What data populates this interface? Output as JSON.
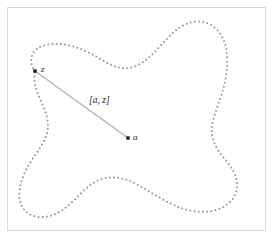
{
  "figure": {
    "caption_none": "",
    "background_color": "#ffffff",
    "frame": {
      "border_color": "#d8d8d8",
      "x": 7,
      "y": 7,
      "width": 259,
      "height": 224
    },
    "region": {
      "name": "star-shaped-region-boundary",
      "style": "dotted",
      "dot_color": "#9a9aa6",
      "dot_radius": 1.0,
      "dot_spacing": 4.2,
      "closed": true,
      "path": "M 35 72 C 27 60, 32 48, 46 45 C 62 41, 82 48, 97 57 C 110 65, 122 72, 136 66 C 152 59, 162 42, 175 31 C 188 20, 204 18, 215 28 C 227 38, 229 56, 226 76 C 223 96, 214 112, 212 126 C 210 142, 219 152, 228 163 C 238 175, 241 190, 231 201 C 220 213, 200 214, 184 209 C 168 204, 154 194, 140 186 C 126 178, 111 174, 97 181 C 83 188, 74 203, 61 211 C 47 220, 30 219, 23 208 C 16 197, 20 181, 27 168 C 34 155, 44 145, 47 133 C 50 120, 45 110, 40 99 C 36 90, 33 81, 35 72 Z"
    },
    "points": [
      {
        "id": "z",
        "label": "z",
        "x": 35,
        "y": 71,
        "marker": "filled-square",
        "color": "#1e1e1e"
      },
      {
        "id": "a",
        "label": "a",
        "x": 128,
        "y": 138,
        "marker": "filled-square",
        "color": "#1e1e1e"
      }
    ],
    "segment": {
      "name": "segment-a-z",
      "label": "[a, z]",
      "from": "z",
      "to": "a",
      "x1": 35,
      "y1": 71,
      "x2": 128,
      "y2": 138,
      "color": "#b0b0b0",
      "width": 1.4
    }
  }
}
